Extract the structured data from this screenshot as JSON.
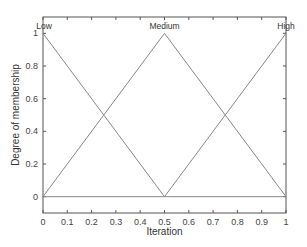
{
  "chart_data": {
    "type": "line",
    "title": "",
    "xlabel": "Iteration",
    "ylabel": "Degree of membership",
    "xlim": [
      0,
      1
    ],
    "ylim": [
      -0.1,
      1.1
    ],
    "grid": false,
    "legend": "none",
    "xticks": [
      "0",
      "0.1",
      "0.2",
      "0.3",
      "0.4",
      "0.5",
      "0.6",
      "0.7",
      "0.8",
      "0.9",
      "1"
    ],
    "yticks": [
      "0",
      "0.2",
      "0.4",
      "0.6",
      "0.8",
      "1"
    ],
    "series": [
      {
        "name": "Low",
        "x": [
          0,
          0.5,
          1
        ],
        "y": [
          1,
          0,
          0
        ]
      },
      {
        "name": "Medium",
        "x": [
          0,
          0.5,
          1
        ],
        "y": [
          0,
          1,
          0
        ]
      },
      {
        "name": "High",
        "x": [
          0,
          0.5,
          1
        ],
        "y": [
          0,
          0,
          1
        ]
      }
    ],
    "annotations": [
      {
        "text": "Low",
        "x": 0,
        "y": 1
      },
      {
        "text": "Medium",
        "x": 0.5,
        "y": 1
      },
      {
        "text": "High",
        "x": 1,
        "y": 1
      }
    ],
    "line_color": "#888888"
  }
}
